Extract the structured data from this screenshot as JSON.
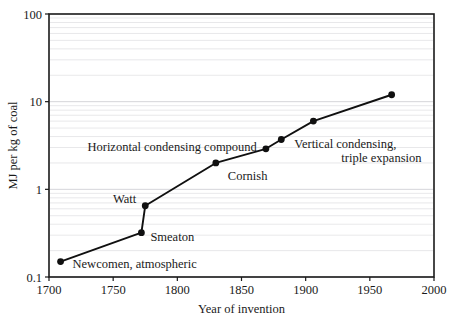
{
  "chart_data": {
    "type": "line",
    "title": "",
    "xlabel": "Year of invention",
    "ylabel": "MJ per kg of coal",
    "xlim": [
      1700,
      2000
    ],
    "ylim": [
      0.1,
      100
    ],
    "yscale": "log",
    "grid": true,
    "legend": "none",
    "x": [
      1709,
      1772,
      1775,
      1830,
      1869,
      1881,
      1906,
      1967
    ],
    "values": [
      0.15,
      0.32,
      0.65,
      2.0,
      2.9,
      3.7,
      6.0,
      12.0
    ],
    "xticks": [
      "1700",
      "1750",
      "1800",
      "1850",
      "1900",
      "1950",
      "2000"
    ],
    "xtick_values": [
      1700,
      1750,
      1800,
      1850,
      1900,
      1950,
      2000
    ],
    "yticks": [
      "0.1",
      "1",
      "10",
      "100"
    ],
    "ytick_values": [
      0.1,
      1,
      10,
      100
    ],
    "annotations": [
      {
        "text": "Newcomen, atmospheric",
        "x": 1709,
        "y": 0.15,
        "anchor": "start",
        "dx": 12,
        "dy": 6
      },
      {
        "text": "Smeaton",
        "x": 1772,
        "y": 0.32,
        "anchor": "start",
        "dx": 9,
        "dy": 8
      },
      {
        "text": "Watt",
        "x": 1775,
        "y": 0.65,
        "anchor": "end",
        "dx": -9,
        "dy": -3
      },
      {
        "text": "Cornish",
        "x": 1830,
        "y": 2.0,
        "anchor": "start",
        "dx": 12,
        "dy": 17
      },
      {
        "text": "Horizontal condensing compound",
        "x": 1869,
        "y": 2.9,
        "anchor": "end",
        "dx": -9,
        "dy": 2
      },
      {
        "text": "Vertical condensing,",
        "x": 1881,
        "y": 3.7,
        "anchor": "start",
        "dx": 13,
        "dy": 8
      },
      {
        "text": "triple expansion",
        "x": 1881,
        "y": 3.7,
        "anchor": "start",
        "dx": 60,
        "dy": 22
      }
    ],
    "point_labels": [
      "Newcomen, atmospheric",
      "Smeaton",
      "Watt",
      "Cornish",
      "Horizontal condensing compound",
      "Vertical condensing, triple expansion",
      "",
      ""
    ],
    "series_color": "#101010"
  }
}
